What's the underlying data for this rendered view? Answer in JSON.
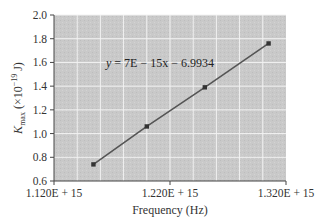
{
  "chart_data": {
    "type": "scatter",
    "title": "",
    "xlabel": "Frequency (Hz)",
    "ylabel": "K_max (×10^-19 J)",
    "ylabel_parts": {
      "main": "K",
      "sub": "max",
      "unit": " (×10",
      "exp": "−19",
      "tail": " J)"
    },
    "xlim": [
      1120000000000000.0,
      1320000000000000.0
    ],
    "ylim": [
      0.6,
      2.0
    ],
    "x_ticks": [
      {
        "value": 1120000000000000.0,
        "label": "1.120E + 15"
      },
      {
        "value": 1220000000000000.0,
        "label": "1.220E + 15"
      },
      {
        "value": 1320000000000000.0,
        "label": "1.320E + 15"
      }
    ],
    "y_ticks": [
      {
        "value": 0.6,
        "label": "0.6"
      },
      {
        "value": 0.8,
        "label": "0.8"
      },
      {
        "value": 1.0,
        "label": "1.0"
      },
      {
        "value": 1.2,
        "label": "1.2"
      },
      {
        "value": 1.4,
        "label": "1.4"
      },
      {
        "value": 1.6,
        "label": "1.6"
      },
      {
        "value": 1.8,
        "label": "1.8"
      },
      {
        "value": 2.0,
        "label": "2.0"
      }
    ],
    "grid": true,
    "x_grid_step": 20000000000000.0,
    "series": [
      {
        "name": "K_max vs frequency",
        "x": [
          1154000000000000.0,
          1200000000000000.0,
          1250000000000000.0,
          1305000000000000.0
        ],
        "y": [
          0.74,
          1.06,
          1.39,
          1.76
        ],
        "color": "#555555",
        "trendline": {
          "type": "linear",
          "slope": 7e-15,
          "intercept": -6.9934
        }
      }
    ],
    "annotations": [
      {
        "text": "y = 7E − 15x − 6.9934",
        "x": 1170000000000000.0,
        "y": 1.6
      }
    ],
    "legend": "none",
    "plot_background": "#c8c8c8"
  }
}
